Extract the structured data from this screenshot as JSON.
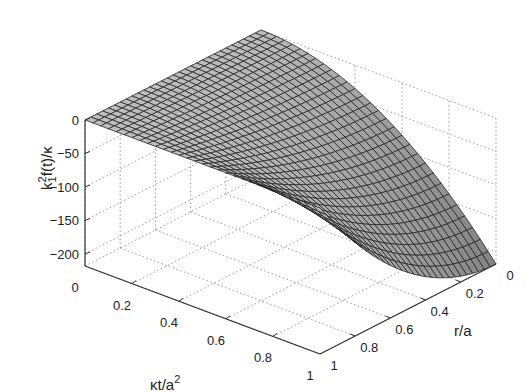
{
  "chart_data": {
    "type": "surface3d",
    "title": "",
    "xlabel": "κt/a²",
    "ylabel": "r/a",
    "zlabel": "k₁²f(t)/κ",
    "x_ticks": [
      "0",
      "0.2",
      "0.4",
      "0.6",
      "0.8",
      "1"
    ],
    "y_ticks": [
      "0",
      "0.2",
      "0.4",
      "0.6",
      "0.8",
      "1"
    ],
    "z_ticks": [
      "0",
      "-50",
      "-100",
      "-150",
      "-200"
    ],
    "xlim": [
      0,
      1
    ],
    "ylim": [
      0,
      1
    ],
    "zlim": [
      -218,
      0
    ],
    "grid": true,
    "surface": {
      "description": "Surface ~ 0 along t=0 and r=1, decreasing to about -218 at t=1, r=0",
      "grid_points": [
        {
          "t": 0,
          "r": 0,
          "z": 0
        },
        {
          "t": 0.5,
          "r": 0,
          "z": -55
        },
        {
          "t": 1,
          "r": 0,
          "z": -218
        },
        {
          "t": 1,
          "r": 0.5,
          "z": -163
        },
        {
          "t": 1,
          "r": 1,
          "z": 0
        },
        {
          "t": 0,
          "r": 1,
          "z": 0
        }
      ],
      "mesh_t_divisions": 30,
      "mesh_r_divisions": 30,
      "face_color": "#b4b4b4",
      "edge_color": "#222222"
    }
  },
  "axes": {
    "z_label_text": "k",
    "z_label_sup": "2",
    "z_label_sub": "1",
    "z_label_rest": "f(t)/κ",
    "x_label_text": "κt/a",
    "x_label_sup": "2",
    "y_label_text": "r/a"
  }
}
